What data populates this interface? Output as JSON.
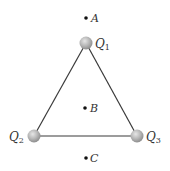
{
  "diagram": {
    "title": "",
    "colors": {
      "edge": "#3a3a3a",
      "charge_fill": "#b5b5b5",
      "charge_highlight": "#e6e6e6",
      "point": "#111111",
      "text": "#333333"
    },
    "charges": [
      {
        "id": "Q1",
        "letter": "Q",
        "subscript": "1",
        "x": 86,
        "y": 43
      },
      {
        "id": "Q2",
        "letter": "Q",
        "subscript": "2",
        "x": 34,
        "y": 136
      },
      {
        "id": "Q3",
        "letter": "Q",
        "subscript": "3",
        "x": 137,
        "y": 136
      }
    ],
    "points": [
      {
        "id": "A",
        "label": "A",
        "x": 86,
        "y": 18
      },
      {
        "id": "B",
        "label": "B",
        "x": 85,
        "y": 108
      },
      {
        "id": "C",
        "label": "C",
        "x": 86,
        "y": 158
      }
    ],
    "edges": [
      [
        "Q1",
        "Q2"
      ],
      [
        "Q2",
        "Q3"
      ],
      [
        "Q3",
        "Q1"
      ]
    ]
  }
}
